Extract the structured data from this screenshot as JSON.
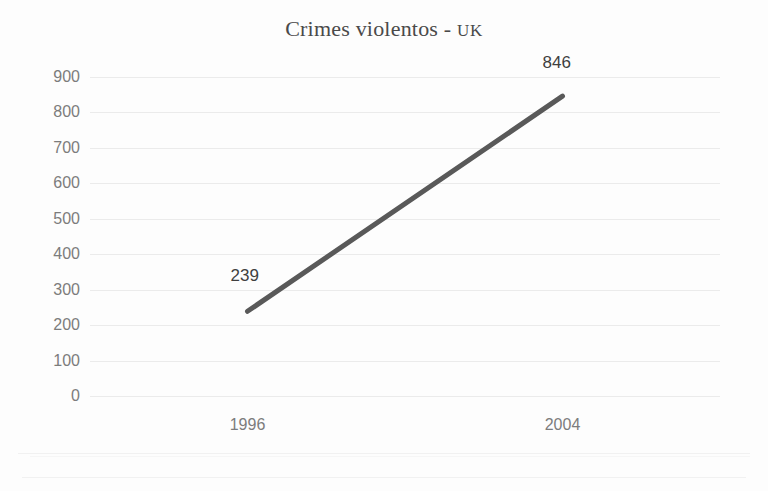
{
  "chart_data": {
    "type": "line",
    "title": "Crimes violentos - UK",
    "title_main": "Crimes violentos - ",
    "title_smallcaps": "UK",
    "xlabel": "",
    "ylabel": "",
    "categories": [
      "1996",
      "2004"
    ],
    "x": [
      1996,
      2004
    ],
    "values": [
      239,
      846
    ],
    "series": [
      {
        "name": "Crimes violentos - UK",
        "values": [
          239,
          846
        ],
        "color": "#595959"
      }
    ],
    "point_labels": [
      "239",
      "846"
    ],
    "ylim": [
      0,
      900
    ],
    "yticks": [
      900,
      800,
      700,
      600,
      500,
      400,
      300,
      200,
      100,
      0
    ],
    "ytick_labels": [
      "900",
      "800",
      "700",
      "600",
      "500",
      "400",
      "300",
      "200",
      "100",
      "0"
    ],
    "grid": true,
    "grid_axis": "y",
    "grid_color": "#ebebeb",
    "legend": "none",
    "background_color": "#fdfdfd",
    "axis_label_color": "#7c7c7c",
    "title_color": "#4a4a4a"
  }
}
